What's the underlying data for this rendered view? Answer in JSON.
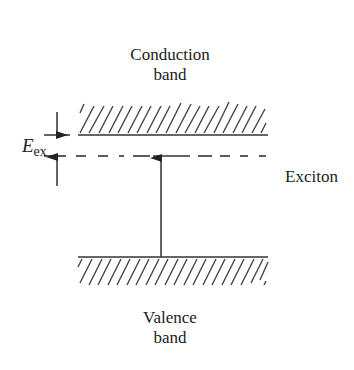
{
  "diagram": {
    "type": "energy-band-diagram",
    "labels": {
      "conduction_line1": "Conduction",
      "conduction_line2": "band",
      "valence_line1": "Valence",
      "valence_line2": "band",
      "exciton": "Exciton",
      "energy_symbol": "E",
      "energy_subscript": "ex"
    },
    "elements": {
      "conduction_band_edge": {
        "x1": 78,
        "x2": 268,
        "y": 135,
        "hatch": "above"
      },
      "exciton_level": {
        "x1": 44,
        "x2": 268,
        "y": 156,
        "style": "dashed"
      },
      "valence_band_edge": {
        "x1": 78,
        "x2": 268,
        "y": 257,
        "hatch": "below"
      },
      "excitation_arrow": {
        "x": 161,
        "from_y": 257,
        "to_y": 158
      },
      "gap_indicator_arrows": {
        "x": 57,
        "top_y": 135,
        "bottom_y": 158
      }
    },
    "colors": {
      "ink": "#333333",
      "background": "#ffffff"
    }
  }
}
